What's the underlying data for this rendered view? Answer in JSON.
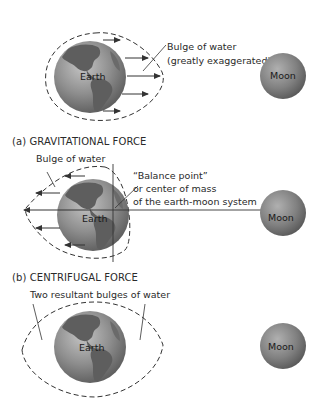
{
  "panels": [
    {
      "id": "gravitational",
      "caption": "(a) GRAVITATIONAL FORCE",
      "earth_label": "Earth",
      "moon_label": "Moon",
      "annotation_line1": "Bulge of water",
      "annotation_line2": "(greatly exaggerated)"
    },
    {
      "id": "centrifugal",
      "caption": "(b) CENTRIFUGAL FORCE",
      "earth_label": "Earth",
      "moon_label": "Moon",
      "bulge_label": "Bulge of water",
      "balance_line1": "“Balance point”",
      "balance_line2": "or center of mass",
      "balance_line3": "of the earth-moon system"
    },
    {
      "id": "resultant",
      "earth_label": "Earth",
      "moon_label": "Moon",
      "bulges_label": "Two resultant bulges of water"
    }
  ],
  "colors": {
    "earth_ocean": "#8c8c8c",
    "earth_land": "#5e5e5e",
    "moon": "#8a8a8a",
    "line": "#333333",
    "text": "#2a2a2a"
  }
}
